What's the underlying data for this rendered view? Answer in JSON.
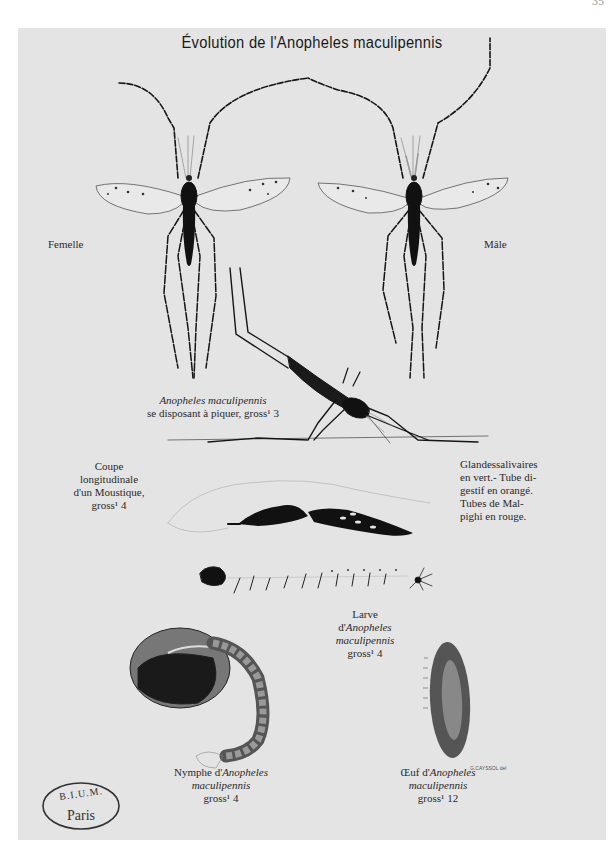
{
  "page": {
    "page_number": "35"
  },
  "plate": {
    "title": "Évolution de l'Anopheles maculipennis",
    "background_color": "#e4e4e4",
    "ink_color": "#111111"
  },
  "figures": {
    "female": {
      "label": "Femelle"
    },
    "male": {
      "label": "Mâle"
    },
    "biting": {
      "label_species": "Anopheles maculipennis",
      "label_desc": "se disposant à piquer, gross¹ 3"
    },
    "section": {
      "label_line1": "Coupe",
      "label_line2": "longitudinale",
      "label_line3": "d'un Moustique,",
      "label_line4": "gross¹ 4"
    },
    "section_legend": {
      "line1": "Glandessalivaires",
      "line2": "en vert.- Tube di-",
      "line3": "gestif en orangé.",
      "line4": "Tubes de Mal-",
      "line5": "pighi en rouge."
    },
    "larva": {
      "label_line1": "Larve",
      "label_prefix": "d'",
      "label_species1": "Anopheles",
      "label_species2": "maculipennis",
      "label_magnification": "gross¹ 4"
    },
    "nymph": {
      "label_prefix": "Nymphe d'",
      "label_species1": "Anopheles",
      "label_species2": "maculipennis",
      "label_magnification": "gross¹ 4"
    },
    "egg": {
      "label_prefix": "Œuf d'",
      "label_species1": "Anopheles",
      "label_species2": "maculipennis",
      "label_magnification": "gross¹ 12",
      "signature": "G.CAYSSOL del"
    }
  },
  "stamp": {
    "top_text": "B.I.U.M.",
    "bottom_text": "Paris"
  }
}
